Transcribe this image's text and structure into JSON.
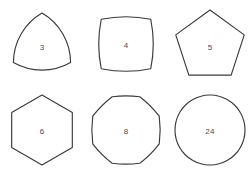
{
  "figure": {
    "background_color": "#ffffff",
    "stroke_color": "#3a3a3c",
    "label_color": "#4a4a4c",
    "rows": 2,
    "columns": 3
  },
  "shapes": [
    {
      "label": "3",
      "name": "reuleaux-triangle",
      "sides": 3,
      "edge_style": "outward-arc",
      "row": 0,
      "column": 0
    },
    {
      "label": "4",
      "name": "reuleaux-quadrilateral",
      "sides": 4,
      "edge_style": "outward-arc",
      "row": 0,
      "column": 1
    },
    {
      "label": "5",
      "name": "reuleaux-pentagon",
      "sides": 5,
      "edge_style": "straight",
      "row": 0,
      "column": 2
    },
    {
      "label": "6",
      "name": "reuleaux-hexagon",
      "sides": 6,
      "edge_style": "straight",
      "row": 1,
      "column": 0
    },
    {
      "label": "8",
      "name": "reuleaux-octagon",
      "sides": 8,
      "edge_style": "outward-arc",
      "row": 1,
      "column": 1
    },
    {
      "label": "24",
      "name": "reuleaux-24-gon",
      "sides": 24,
      "edge_style": "outward-arc",
      "row": 1,
      "column": 2
    }
  ]
}
